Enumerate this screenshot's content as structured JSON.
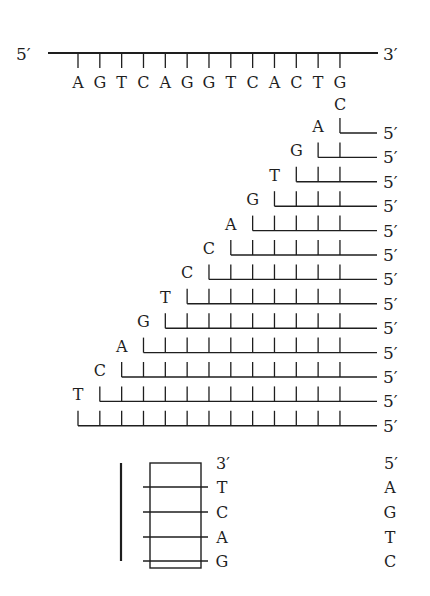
{
  "template_strand": {
    "five_prime_label": "5′",
    "three_prime_label": "3′",
    "bases": [
      "A",
      "G",
      "T",
      "C",
      "A",
      "G",
      "G",
      "T",
      "C",
      "A",
      "C",
      "T",
      "G"
    ]
  },
  "primer_first_base": "C",
  "fragments": {
    "end_label": "5′",
    "terminal_bases": [
      "A",
      "G",
      "T",
      "G",
      "A",
      "C",
      "C",
      "T",
      "G",
      "A",
      "C",
      "T",
      ""
    ]
  },
  "gel": {
    "left_column": {
      "header": "3′",
      "bases": [
        "T",
        "C",
        "A",
        "G"
      ]
    },
    "right_column": {
      "header": "5′",
      "bases": [
        "A",
        "G",
        "T",
        "C"
      ]
    }
  },
  "colors": {
    "ink": "#1e1e1e",
    "background": "#ffffff"
  }
}
